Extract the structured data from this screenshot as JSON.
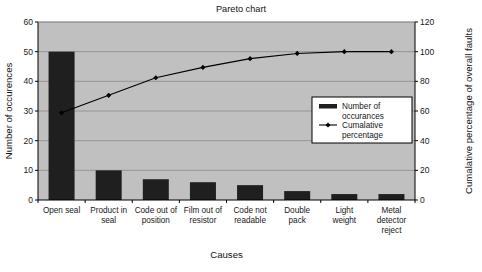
{
  "chart_data": {
    "type": "bar",
    "title": "Pareto chart",
    "xlabel": "Causes",
    "ylabel": "Number of occurences",
    "y2label": "Cumalative percentage of overall faults",
    "categories": [
      "Open seal",
      "Product in seal",
      "Code out of position",
      "Film out of resistor",
      "Code not readable",
      "Double pack",
      "Light weight",
      "Metal detector reject"
    ],
    "series": [
      {
        "name": "Number of occurances",
        "type": "bar",
        "axis": "left",
        "values": [
          50,
          10,
          7,
          6,
          5,
          3,
          2,
          2
        ]
      },
      {
        "name": "Cumalative percentage",
        "type": "line",
        "axis": "right",
        "values": [
          58.8,
          70.6,
          82.4,
          89.4,
          95.3,
          98.8,
          100,
          100
        ]
      }
    ],
    "ylim": [
      0,
      60
    ],
    "yticks": [
      0,
      10,
      20,
      30,
      40,
      50,
      60
    ],
    "y2lim": [
      0,
      120
    ],
    "y2ticks": [
      0,
      20,
      40,
      60,
      80,
      100,
      120
    ],
    "grid": true,
    "legend_position": "inside-right",
    "colors": {
      "plot_background": "#c0c0c0",
      "page_background": "#ffffff",
      "bar_fill": "#1f1f1f",
      "line_stroke": "#000000",
      "marker_fill": "#000000",
      "grid_line": "#8a8a8a",
      "axis_line": "#000000",
      "legend_background": "#ffffff",
      "legend_border": "#000000",
      "text": "#181818"
    }
  },
  "legend": {
    "items": [
      {
        "label_line1": "Number of",
        "label_line2": "occurances",
        "marker": "bar-swatch"
      },
      {
        "label_line1": "Cumalative",
        "label_line2": "percentage",
        "marker": "line-marker"
      }
    ]
  },
  "category_lines": [
    [
      "Open seal"
    ],
    [
      "Product in",
      "seal"
    ],
    [
      "Code out of",
      "position"
    ],
    [
      "Film out of",
      "resistor"
    ],
    [
      "Code not",
      "readable"
    ],
    [
      "Double",
      "pack"
    ],
    [
      "Light",
      "weight"
    ],
    [
      "Metal",
      "detector",
      "reject"
    ]
  ]
}
